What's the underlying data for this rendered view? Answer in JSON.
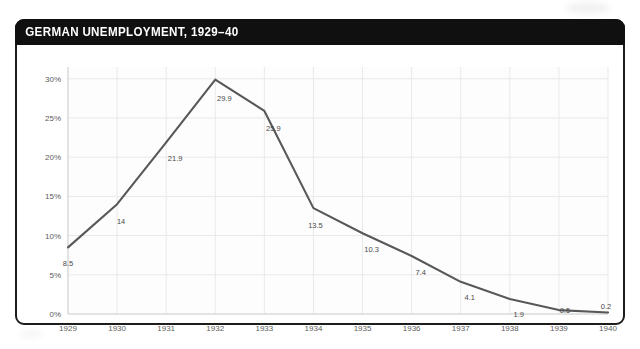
{
  "chart_data": {
    "type": "line",
    "title": "GERMAN UNEMPLOYMENT, 1929–40",
    "xlabel": "",
    "ylabel": "",
    "x": [
      1929,
      1930,
      1931,
      1932,
      1933,
      1934,
      1935,
      1936,
      1937,
      1938,
      1939,
      1940
    ],
    "categories": [
      "1929",
      "1930",
      "1931",
      "1932",
      "1933",
      "1934",
      "1935",
      "1936",
      "1937",
      "1938",
      "1939",
      "1940"
    ],
    "values": [
      8.5,
      14,
      21.9,
      29.9,
      25.9,
      13.5,
      10.3,
      7.4,
      4.1,
      1.9,
      0.5,
      0.2
    ],
    "point_labels": [
      "8.5",
      "14",
      "21.9",
      "29.9",
      "25.9",
      "13.5",
      "10.3",
      "7.4",
      "4.1",
      "1.9",
      "0.5",
      "0.2"
    ],
    "ylim": [
      0,
      31.5
    ],
    "yticks": [
      0,
      5,
      10,
      15,
      20,
      25,
      30
    ],
    "ytick_labels": [
      "0%",
      "5%",
      "10%",
      "15%",
      "20%",
      "25%",
      "30%"
    ],
    "grid": true,
    "legend": null,
    "series_name": "Unemployment rate (%)",
    "line_color": "#585858",
    "grid_color": "#e9e9e9",
    "plot_bg": "#fdfdfd",
    "title_bar_color": "#101010",
    "title_text_color": "#ffffff",
    "frame_color": "#1c1c1c"
  }
}
